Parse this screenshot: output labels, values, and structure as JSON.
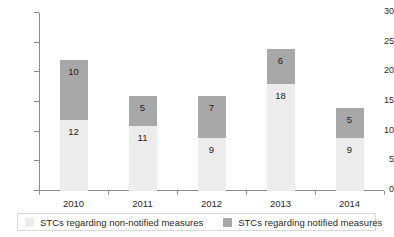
{
  "chart_data": {
    "type": "bar",
    "stacked": true,
    "title": "",
    "xlabel": "",
    "ylabel": "",
    "categories": [
      "2010",
      "2011",
      "2012",
      "2013",
      "2014"
    ],
    "series": [
      {
        "name": "STCs regarding non-notified measures",
        "color": "#ececec",
        "values": [
          12,
          11,
          9,
          18,
          9
        ]
      },
      {
        "name": "STCs regarding notified measures",
        "color": "#a8a8a8",
        "values": [
          10,
          5,
          7,
          6,
          5
        ]
      }
    ],
    "totals": [
      22,
      16,
      16,
      24,
      14
    ],
    "ylim": [
      0,
      30
    ],
    "yticks": [
      0,
      5,
      10,
      15,
      20,
      25,
      30
    ],
    "ytick_labels": [
      "0",
      "5",
      "10",
      "15",
      "20",
      "25",
      "30"
    ],
    "grid": false,
    "legend_position": "bottom",
    "data_labels": true
  },
  "legend": {
    "items": [
      {
        "label": "STCs regarding non-notified measures",
        "swatch": "#ececec"
      },
      {
        "label": "STCs regarding notified measures",
        "swatch": "#a8a8a8"
      }
    ]
  }
}
